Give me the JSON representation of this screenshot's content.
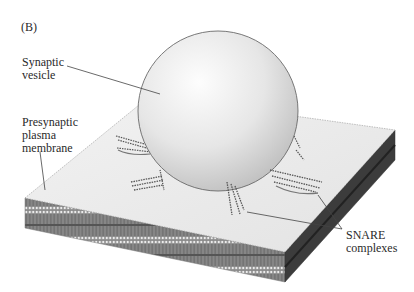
{
  "figure": {
    "panel_label": "(B)",
    "labels": {
      "vesicle": "Synaptic\nvesicle",
      "membrane": "Presynaptic\nplasma\nmembrane",
      "snare": "SNARE\ncomplexes"
    },
    "colors": {
      "background": "#ffffff",
      "membrane_top": "#ececec",
      "membrane_side_left": "#7a7a7a",
      "membrane_side_right": "#3a3a3a",
      "vesicle_light": "#fbfbfb",
      "vesicle_dark": "#c8c8c8",
      "snare": "#6a6a6a",
      "leader_line": "#444444"
    }
  }
}
